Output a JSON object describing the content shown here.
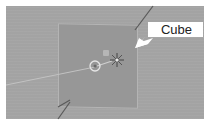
{
  "viewport": {
    "background": "#a3a3a3",
    "plane_color": "#979797",
    "callout": {
      "label": "Cube",
      "background": "#ffffff"
    },
    "icons": [
      "origin-point-icon",
      "3d-cursor-icon",
      "light-icon",
      "callout-arrow-icon"
    ]
  }
}
